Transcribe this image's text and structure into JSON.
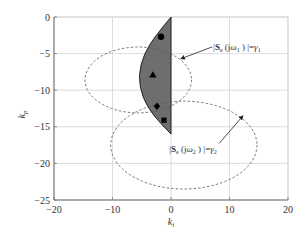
{
  "chart_data": {
    "type": "scatter",
    "title": "",
    "xlabel": "k_i",
    "ylabel": "k_p",
    "xlim": [
      -20,
      20
    ],
    "ylim": [
      -25,
      0
    ],
    "grid": true,
    "xticks": [
      -20,
      -10,
      0,
      10,
      20
    ],
    "yticks": [
      0,
      -5,
      -10,
      -15,
      -20,
      -25
    ],
    "xtick_labels": [
      "−20",
      "−10",
      "0",
      "10",
      "20"
    ],
    "ytick_labels": [
      "0",
      "−5",
      "−10",
      "−15",
      "−20",
      "−25"
    ],
    "shaded_region": {
      "description": "Stabilizing region (dark gray, half-lens shape bounded by ki = 0)",
      "color": "#6e6e6e",
      "boundary": [
        [
          0,
          0
        ],
        [
          -2.6,
          -2.5
        ],
        [
          -4.6,
          -5
        ],
        [
          -5.6,
          -8
        ],
        [
          -4.9,
          -11
        ],
        [
          -3,
          -13.5
        ],
        [
          0,
          -16
        ]
      ]
    },
    "ellipses": [
      {
        "name": "|S_e(jω1)| = γ1",
        "center": [
          -5.6,
          -8.6
        ],
        "rx": 9.1,
        "ry": 4.5,
        "style": "dashed"
      },
      {
        "name": "|S_e(jω2)| = γ2",
        "center": [
          2.2,
          -17.5
        ],
        "rx": 12.5,
        "ry": 6.0,
        "style": "dashed"
      }
    ],
    "markers": [
      {
        "shape": "circle",
        "x": -1.7,
        "y": -2.7
      },
      {
        "shape": "triangle",
        "x": -3.1,
        "y": -7.9
      },
      {
        "shape": "diamond",
        "x": -2.4,
        "y": -12.2
      },
      {
        "shape": "square",
        "x": -1.2,
        "y": -14.1
      }
    ],
    "annotations": [
      {
        "text_bold": "S",
        "sub": "e",
        "mid": "(jω",
        "sub2": "1",
        "tail": ") |=γ",
        "sub3": "1",
        "prefix": "|",
        "text_xy": [
          7.2,
          -4.5
        ],
        "arrow_to": [
          1.7,
          -5.7
        ]
      },
      {
        "text_bold": "S",
        "sub": "e",
        "mid": "(jω",
        "sub2": "2",
        "tail": ") |=γ",
        "sub3": "2",
        "prefix": "|",
        "text_xy": [
          -0.3,
          -18.5
        ],
        "arrow_to": [
          12.3,
          -13.5
        ]
      }
    ]
  }
}
